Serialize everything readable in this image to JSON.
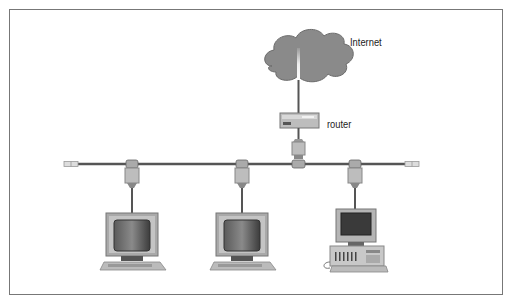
{
  "diagram": {
    "type": "network-topology",
    "labels": {
      "internet": "Internet",
      "router": "router"
    },
    "nodes": [
      {
        "id": "internet",
        "kind": "cloud",
        "label": "Internet"
      },
      {
        "id": "router",
        "kind": "router",
        "label": "router"
      },
      {
        "id": "pc1",
        "kind": "workstation-monitor",
        "label": ""
      },
      {
        "id": "pc2",
        "kind": "workstation-monitor",
        "label": ""
      },
      {
        "id": "pc3",
        "kind": "desktop-computer",
        "label": ""
      }
    ],
    "edges": [
      {
        "from": "internet",
        "to": "router"
      },
      {
        "from": "router",
        "to": "bus"
      },
      {
        "from": "bus",
        "to": "pc1"
      },
      {
        "from": "bus",
        "to": "pc2"
      },
      {
        "from": "bus",
        "to": "pc3"
      }
    ],
    "colors": {
      "cloud": "#8a8a8a",
      "cable": "#555555",
      "connector": "#b5b5b5",
      "monitor_bezel": "#a9a9a9",
      "screen": "#4a4a4a",
      "frame": "#777777"
    }
  }
}
